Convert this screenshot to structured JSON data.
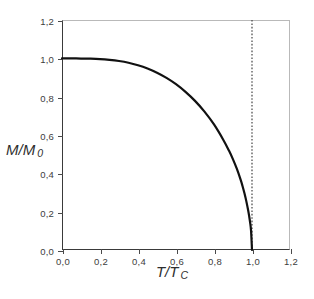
{
  "chart_data": {
    "type": "line",
    "title": "",
    "xlabel": "T/T",
    "xlabel_sub": "C",
    "ylabel": "M/M",
    "ylabel_sub": "0",
    "xlim": [
      0.0,
      1.2
    ],
    "ylim": [
      0.0,
      1.2
    ],
    "grid": false,
    "legend": null,
    "decimal_separator": ",",
    "xticks": [
      0.0,
      0.2,
      0.4,
      0.6,
      0.8,
      1.0,
      1.2
    ],
    "xticklabels": [
      "0,0",
      "0,2",
      "0,4",
      "0,6",
      "0,8",
      "1,0",
      "1,2"
    ],
    "yticks": [
      0.0,
      0.2,
      0.4,
      0.6,
      0.8,
      1.0,
      1.2
    ],
    "yticklabels": [
      "0,0",
      "0,2",
      "0,4",
      "0,6",
      "0,8",
      "1,0",
      "1,2"
    ],
    "series": [
      {
        "name": "spontaneous magnetization",
        "color": "#111111",
        "x": [
          0.0,
          0.05,
          0.1,
          0.15,
          0.2,
          0.25,
          0.3,
          0.35,
          0.4,
          0.45,
          0.5,
          0.55,
          0.6,
          0.65,
          0.7,
          0.75,
          0.8,
          0.85,
          0.88,
          0.9,
          0.92,
          0.94,
          0.95,
          0.96,
          0.97,
          0.98,
          0.985,
          0.99,
          0.995,
          1.0
        ],
        "values": [
          1.0,
          1.0,
          0.999,
          0.998,
          0.996,
          0.992,
          0.986,
          0.977,
          0.964,
          0.947,
          0.925,
          0.898,
          0.865,
          0.825,
          0.778,
          0.722,
          0.655,
          0.573,
          0.516,
          0.473,
          0.424,
          0.367,
          0.334,
          0.297,
          0.255,
          0.206,
          0.177,
          0.144,
          0.101,
          0.0
        ]
      }
    ],
    "annotations": [
      {
        "name": "critical-temperature-line",
        "type": "vertical-dashed-line",
        "x": 1.0,
        "style": "dotted",
        "color": "#444444"
      }
    ]
  }
}
